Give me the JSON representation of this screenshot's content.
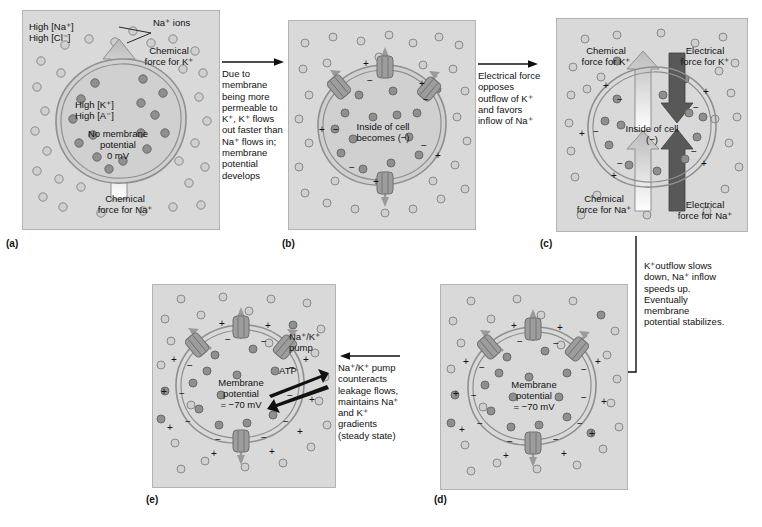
{
  "figure": {
    "panels": [
      {
        "id": "a",
        "letter": "(a)",
        "labels": {
          "outside_na": "High [Na⁺]",
          "outside_cl": "High [Cl⁻]",
          "na_ions_callout": "Na⁺ ions",
          "chemical_force_k": "Chemical\nforce for K⁺",
          "inside_k": "High [K⁺]",
          "inside_a": "High [A⁻]",
          "potential": "No membrane\npotential\n0 mV",
          "chemical_force_na": "Chemical\nforce for Na⁺"
        }
      },
      {
        "id": "b",
        "letter": "(b)",
        "labels": {
          "inside": "Inside of cell\nbecomes (−)"
        }
      },
      {
        "id": "c",
        "letter": "(c)",
        "labels": {
          "chemical_force_k": "Chemical\nforce for K⁺",
          "electrical_force_k": "Electrical\nforce for K⁺",
          "inside": "Inside of cell\n(−)",
          "chemical_force_na": "Chemical\nforce for Na⁺",
          "electrical_force_na": "Electrical\nforce for Na⁺"
        }
      },
      {
        "id": "d",
        "letter": "(d)",
        "labels": {
          "potential": "Membrane\npotential\n= −70 mV"
        }
      },
      {
        "id": "e",
        "letter": "(e)",
        "labels": {
          "potential": "Membrane\npotential\n= −70 mV",
          "pump": "Na⁺/K⁺\npump",
          "atp": "ATP"
        }
      }
    ],
    "connectors": [
      {
        "id": "a-to-b",
        "text": "Due to\nmembrane\nbeing more\npermeable to\nK⁺, K⁺ flows\nout faster than\nNa⁺ flows in;\nmembrane\npotential\ndevelops"
      },
      {
        "id": "b-to-c",
        "text": "Electrical force\nopposes\noutflow of K⁺\nand favors\ninflow of Na⁺"
      },
      {
        "id": "c-to-d",
        "text": "K⁺outflow slows\ndown, Na⁺ inflow\nspeeds up.\nEventually\nmembrane\npotential stabilizes."
      },
      {
        "id": "d-to-e",
        "text": "Na⁺/K⁺ pump\ncounteracts\nleakage flows,\nmaintains Na⁺\nand K⁺\ngradients\n(steady state)"
      }
    ],
    "colors": {
      "panel_background": "#d9d9d9",
      "ion_outside": "#cfcfcf",
      "ion_inside": "#8f8f8f",
      "chemical_arrow": "#d0d0d0",
      "electrical_arrow": "#585858",
      "membrane": "#9a9a9a",
      "channel": "#9d9d9d",
      "text": "#111111"
    }
  }
}
